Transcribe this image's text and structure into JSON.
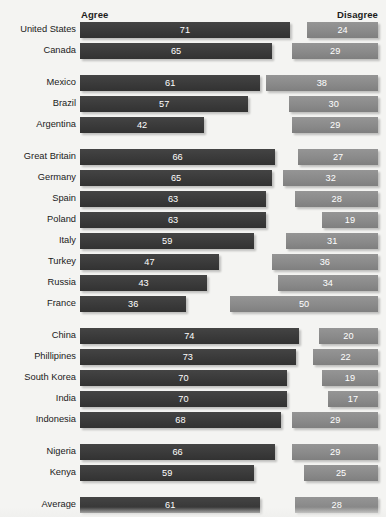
{
  "chart": {
    "title": "",
    "headers": {
      "left": "Agree",
      "right": "Disagree"
    },
    "colors": {
      "agree": "#3a3a3a",
      "disagree": "#8a8a8a",
      "background": "#f4f4f2",
      "label": "#1a1a1a"
    }
  },
  "chart_data": {
    "type": "bar",
    "title": "",
    "xlabel": "",
    "ylabel": "",
    "orientation": "horizontal",
    "layout": "diverging",
    "grid": false,
    "legend_position": "top",
    "xlim": [
      0,
      100
    ],
    "categories": [
      "United States",
      "Canada",
      "Mexico",
      "Brazil",
      "Argentina",
      "Great Britain",
      "Germany",
      "Spain",
      "Poland",
      "Italy",
      "Turkey",
      "Russia",
      "France",
      "China",
      "Phillipines",
      "South Korea",
      "India",
      "Indonesia",
      "Nigeria",
      "Kenya",
      "Average"
    ],
    "series": [
      {
        "name": "Agree",
        "values": [
          71,
          65,
          61,
          57,
          42,
          66,
          65,
          63,
          63,
          59,
          47,
          43,
          36,
          74,
          73,
          70,
          70,
          68,
          66,
          59,
          61
        ]
      },
      {
        "name": "Disagree",
        "values": [
          24,
          29,
          38,
          30,
          29,
          27,
          32,
          28,
          19,
          31,
          36,
          34,
          50,
          20,
          22,
          19,
          17,
          29,
          29,
          25,
          28
        ]
      }
    ],
    "groups": [
      {
        "name": "North America",
        "rows": [
          "United States",
          "Canada"
        ]
      },
      {
        "name": "Latin America",
        "rows": [
          "Mexico",
          "Brazil",
          "Argentina"
        ]
      },
      {
        "name": "Europe",
        "rows": [
          "Great Britain",
          "Germany",
          "Spain",
          "Poland",
          "Italy",
          "Turkey",
          "Russia",
          "France"
        ]
      },
      {
        "name": "Asia",
        "rows": [
          "China",
          "Phillipines",
          "South Korea",
          "India",
          "Indonesia"
        ]
      },
      {
        "name": "Africa",
        "rows": [
          "Nigeria",
          "Kenya"
        ]
      },
      {
        "name": "Summary",
        "rows": [
          "Average"
        ]
      }
    ],
    "rows": [
      {
        "label": "United States",
        "agree": 71,
        "disagree": 24,
        "group": 0
      },
      {
        "label": "Canada",
        "agree": 65,
        "disagree": 29,
        "group": 0
      },
      {
        "label": "Mexico",
        "agree": 61,
        "disagree": 38,
        "group": 1
      },
      {
        "label": "Brazil",
        "agree": 57,
        "disagree": 30,
        "group": 1
      },
      {
        "label": "Argentina",
        "agree": 42,
        "disagree": 29,
        "group": 1
      },
      {
        "label": "Great Britain",
        "agree": 66,
        "disagree": 27,
        "group": 2
      },
      {
        "label": "Germany",
        "agree": 65,
        "disagree": 32,
        "group": 2
      },
      {
        "label": "Spain",
        "agree": 63,
        "disagree": 28,
        "group": 2
      },
      {
        "label": "Poland",
        "agree": 63,
        "disagree": 19,
        "group": 2
      },
      {
        "label": "Italy",
        "agree": 59,
        "disagree": 31,
        "group": 2
      },
      {
        "label": "Turkey",
        "agree": 47,
        "disagree": 36,
        "group": 2
      },
      {
        "label": "Russia",
        "agree": 43,
        "disagree": 34,
        "group": 2
      },
      {
        "label": "France",
        "agree": 36,
        "disagree": 50,
        "group": 2
      },
      {
        "label": "China",
        "agree": 74,
        "disagree": 20,
        "group": 3
      },
      {
        "label": "Phillipines",
        "agree": 73,
        "disagree": 22,
        "group": 3
      },
      {
        "label": "South Korea",
        "agree": 70,
        "disagree": 19,
        "group": 3
      },
      {
        "label": "India",
        "agree": 70,
        "disagree": 17,
        "group": 3
      },
      {
        "label": "Indonesia",
        "agree": 68,
        "disagree": 29,
        "group": 3
      },
      {
        "label": "Nigeria",
        "agree": 66,
        "disagree": 29,
        "group": 4
      },
      {
        "label": "Kenya",
        "agree": 59,
        "disagree": 25,
        "group": 4
      },
      {
        "label": "Average",
        "agree": 61,
        "disagree": 28,
        "group": 5
      }
    ]
  }
}
